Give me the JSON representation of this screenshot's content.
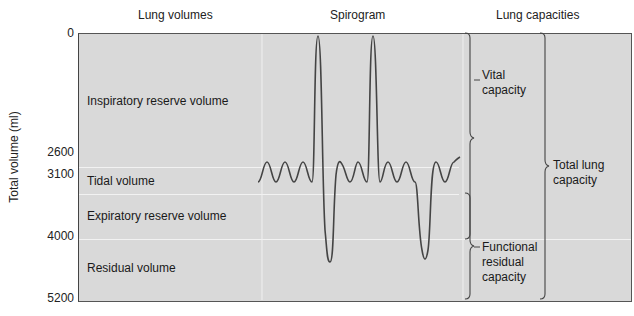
{
  "headers": {
    "lung_volumes": "Lung volumes",
    "spirogram": "Spirogram",
    "lung_capacities": "Lung capacities"
  },
  "y_axis": {
    "title": "Total volume (ml)",
    "ticks": [
      "0",
      "2600",
      "3100",
      "4000",
      "5200"
    ]
  },
  "volumes": [
    {
      "label": "Inspiratory reserve volume"
    },
    {
      "label": "Tidal volume"
    },
    {
      "label": "Expiratory reserve volume"
    },
    {
      "label": "Residual volume"
    }
  ],
  "capacities": [
    {
      "label_lines": [
        "Vital",
        "capacity"
      ]
    },
    {
      "label_lines": [
        "Total lung",
        "capacity"
      ]
    },
    {
      "label_lines": [
        "Functional",
        "residual",
        "capacity"
      ]
    }
  ],
  "colors": {
    "frame_fill": "#d9d9d9",
    "line": "#444444",
    "band_line": "#f2f2f2"
  }
}
